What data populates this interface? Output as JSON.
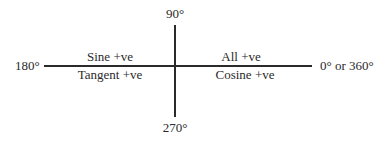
{
  "diagram": {
    "type": "quadrant-diagram",
    "topic": "Signs of trigonometric functions (CAST rule)",
    "axes": {
      "top": "90°",
      "bottom": "270°",
      "left": "180°",
      "right": "0° or 360°"
    },
    "quadrants": {
      "second_upper": "Sine +ve",
      "third_lower": "Tangent +ve",
      "first_upper": "All +ve",
      "fourth_lower": "Cosine +ve"
    },
    "colors": {
      "line": "#2a2a2a",
      "text": "#2a2a2a",
      "background": "#ffffff"
    }
  }
}
